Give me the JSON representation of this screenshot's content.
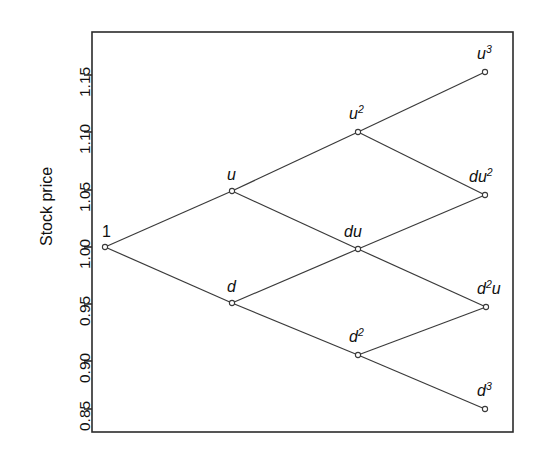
{
  "chart_data": {
    "type": "scatter",
    "title": "",
    "xlabel": "",
    "ylabel": "Stock price",
    "grid": false,
    "legend": null,
    "xlim": [
      0,
      3
    ],
    "ylim": [
      0.838,
      1.178
    ],
    "ytick_labels": [
      "0.85",
      "0.90",
      "0.95",
      "1.00",
      "1.05",
      "1.10",
      "1.15"
    ],
    "ytick_values": [
      0.85,
      0.9,
      0.95,
      1.0,
      1.05,
      1.1,
      1.15
    ],
    "xtick_labels": [],
    "annotations": [
      "Recombining binomial tree of stock prices over three steps"
    ],
    "nodes": [
      {
        "id": "root",
        "label": "1",
        "sup": "",
        "step": 0,
        "value": 1.0,
        "px": 105,
        "py": 247,
        "label_dx": -3,
        "label_dy": -24
      },
      {
        "id": "u",
        "label": "u",
        "sup": "",
        "step": 1,
        "value": 1.05,
        "px": 232,
        "py": 191,
        "label_dx": -5,
        "label_dy": -25
      },
      {
        "id": "d",
        "label": "d",
        "sup": "",
        "step": 1,
        "value": 0.95,
        "px": 232,
        "py": 303,
        "label_dx": -5,
        "label_dy": -25
      },
      {
        "id": "u2",
        "label": "u",
        "sup": "2",
        "step": 2,
        "value": 1.103,
        "px": 358,
        "py": 132,
        "label_dx": -9,
        "label_dy": -27
      },
      {
        "id": "du",
        "label": "du",
        "sup": "",
        "step": 2,
        "value": 0.998,
        "px": 358,
        "py": 249,
        "label_dx": -14,
        "label_dy": -26
      },
      {
        "id": "d2",
        "label": "d",
        "sup": "2",
        "step": 2,
        "value": 0.902,
        "px": 358,
        "py": 355,
        "label_dx": -9,
        "label_dy": -27
      },
      {
        "id": "u3",
        "label": "u",
        "sup": "3",
        "step": 3,
        "value": 1.157,
        "px": 485,
        "py": 72,
        "label_dx": -8,
        "label_dy": -27
      },
      {
        "id": "du2",
        "label": "du",
        "sup": "2",
        "step": 3,
        "value": 1.047,
        "px": 485,
        "py": 195,
        "label_dx": -16,
        "label_dy": -27
      },
      {
        "id": "d2u",
        "label": "d",
        "sup": "2",
        "step": 3,
        "value": 0.947,
        "px": 486,
        "py": 307,
        "label_dx": -9,
        "label_dy": -27,
        "suffix": "u"
      },
      {
        "id": "d3",
        "label": "d",
        "sup": "3",
        "step": 3,
        "value": 0.857,
        "px": 485,
        "py": 409,
        "label_dx": -8,
        "label_dy": -27
      }
    ],
    "edges": [
      {
        "from": "root",
        "to": "u"
      },
      {
        "from": "root",
        "to": "d"
      },
      {
        "from": "u",
        "to": "u2"
      },
      {
        "from": "u",
        "to": "du"
      },
      {
        "from": "d",
        "to": "du"
      },
      {
        "from": "d",
        "to": "d2"
      },
      {
        "from": "u2",
        "to": "u3"
      },
      {
        "from": "u2",
        "to": "du2"
      },
      {
        "from": "du",
        "to": "du2"
      },
      {
        "from": "du",
        "to": "d2u"
      },
      {
        "from": "d2",
        "to": "d2u"
      },
      {
        "from": "d2",
        "to": "d3"
      }
    ],
    "colors": {
      "line": "#3a3a3a",
      "frame": "#2b2b2b",
      "text": "#111111",
      "node_fill": "#ffffff",
      "background": "#ffffff"
    },
    "frame": {
      "left": 92,
      "top": 32,
      "right": 513,
      "bottom": 432
    },
    "tick_pixel_y": [
      409,
      361,
      304,
      247,
      190,
      132,
      75
    ]
  }
}
